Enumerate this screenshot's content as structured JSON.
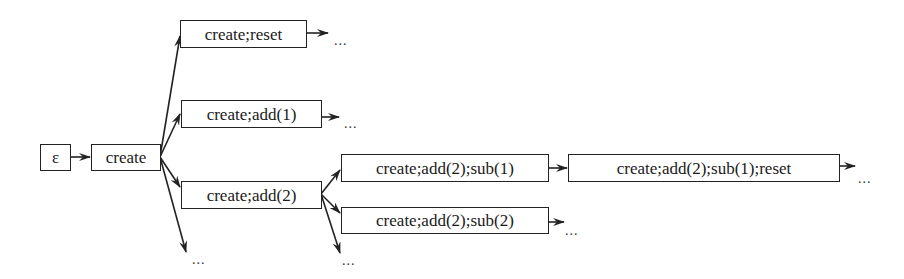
{
  "diagram": {
    "type": "state-tree",
    "nodes": [
      {
        "id": "eps",
        "label": "ε"
      },
      {
        "id": "create",
        "label": "create"
      },
      {
        "id": "create_reset",
        "label": "create;reset"
      },
      {
        "id": "create_add1",
        "label": "create;add(1)"
      },
      {
        "id": "create_add2",
        "label": "create;add(2)"
      },
      {
        "id": "create_add2_sub1",
        "label": "create;add(2);sub(1)"
      },
      {
        "id": "create_add2_sub2",
        "label": "create;add(2);sub(2)"
      },
      {
        "id": "create_add2_sub1_reset",
        "label": "create;add(2);sub(1);reset"
      }
    ],
    "edges": [
      [
        "eps",
        "create"
      ],
      [
        "create",
        "create_reset"
      ],
      [
        "create",
        "create_add1"
      ],
      [
        "create",
        "create_add2"
      ],
      [
        "create",
        "…"
      ],
      [
        "create_add2",
        "create_add2_sub1"
      ],
      [
        "create_add2",
        "create_add2_sub2"
      ],
      [
        "create_add2",
        "…"
      ],
      [
        "create_add2_sub1",
        "create_add2_sub1_reset"
      ],
      [
        "create_reset",
        "…"
      ],
      [
        "create_add1",
        "…"
      ],
      [
        "create_add2_sub2",
        "…"
      ],
      [
        "create_add2_sub1_reset",
        "…"
      ]
    ],
    "ellipsis": "..."
  }
}
